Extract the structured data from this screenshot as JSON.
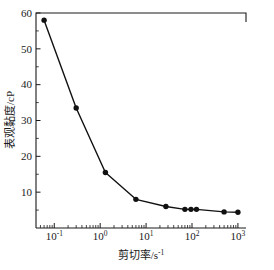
{
  "chart_data": {
    "type": "line",
    "title": "",
    "subtitle": "",
    "xlabel": "剪切率/s⁻¹",
    "ylabel": "表观黏度/cP",
    "xscale": "log",
    "yscale": "linear",
    "xlim": [
      0.04,
      1500
    ],
    "ylim": [
      0,
      60
    ],
    "grid": false,
    "legend": false,
    "legend_position": "none",
    "xticks": [
      "10⁻¹",
      "10⁰",
      "10¹",
      "10²",
      "10³"
    ],
    "xtick_values": [
      0.1,
      1,
      10,
      100,
      1000
    ],
    "xtick_mantissa": [
      "10",
      "10",
      "10",
      "10",
      "10"
    ],
    "xtick_exponents": [
      "-1",
      "0",
      "1",
      "2",
      "3"
    ],
    "yticks": [
      "10",
      "20",
      "30",
      "40",
      "50",
      "60"
    ],
    "ytick_values": [
      10,
      20,
      30,
      40,
      50,
      60
    ],
    "x": [
      0.06,
      0.3,
      1.3,
      6.0,
      27.0,
      70.0,
      95.0,
      125.0,
      500.0,
      1000.0
    ],
    "values": [
      58.0,
      33.5,
      15.5,
      8.0,
      6.0,
      5.2,
      5.2,
      5.2,
      4.5,
      4.4
    ],
    "series": [
      {
        "name": "表观黏度",
        "marker": "filled-circle",
        "color": "#111111",
        "x": [
          0.06,
          0.3,
          1.3,
          6.0,
          27.0,
          70.0,
          95.0,
          125.0,
          500.0,
          1000.0
        ],
        "values": [
          58.0,
          33.5,
          15.5,
          8.0,
          6.0,
          5.2,
          5.2,
          5.2,
          4.5,
          4.4
        ]
      }
    ],
    "annotations": []
  },
  "axes": {
    "x_title_main": "剪切率/s",
    "x_title_exponent": "-1",
    "y_title": "表观黏度/cP"
  },
  "colors": {
    "line": "#111111",
    "marker": "#111111",
    "axis": "#1a1a1a",
    "background": "#ffffff"
  }
}
